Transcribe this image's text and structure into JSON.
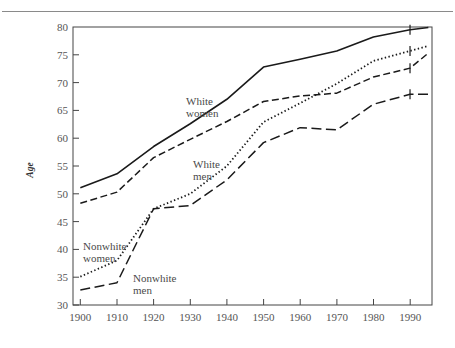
{
  "figure": {
    "rule_present": true,
    "axis": {
      "ylabel": "Age",
      "ylim": [
        30,
        80
      ],
      "yticks": [
        30,
        35,
        40,
        45,
        50,
        55,
        60,
        65,
        70,
        75,
        80
      ],
      "xlim": [
        1898,
        1996
      ],
      "xticks": [
        1900,
        1910,
        1920,
        1930,
        1940,
        1950,
        1960,
        1970,
        1980,
        1990
      ]
    },
    "labels": {
      "white_women_line1": "White",
      "white_women_line2": "women",
      "white_men_line1": "White",
      "white_men_line2": "men",
      "nonwhite_women_line1": "Nonwhite",
      "nonwhite_women_line2": "women",
      "nonwhite_men_line1": "Nonwhite",
      "nonwhite_men_line2": "men"
    }
  },
  "chart_data": {
    "type": "line",
    "title": "",
    "xlabel": "",
    "ylabel": "Age",
    "xlim": [
      1898,
      1996
    ],
    "ylim": [
      30,
      80
    ],
    "xticks": [
      1900,
      1910,
      1920,
      1930,
      1940,
      1950,
      1960,
      1970,
      1980,
      1990
    ],
    "yticks": [
      30,
      35,
      40,
      45,
      50,
      55,
      60,
      65,
      70,
      75,
      80
    ],
    "grid": false,
    "legend": "inline-labels",
    "x": [
      1900,
      1910,
      1920,
      1930,
      1940,
      1950,
      1960,
      1970,
      1980,
      1990,
      1995
    ],
    "series": [
      {
        "name": "White women",
        "style": "solid",
        "color": "#1a1a1a",
        "values": [
          51.1,
          53.6,
          58.5,
          62.6,
          67.0,
          72.8,
          74.2,
          75.7,
          78.2,
          79.5,
          79.9
        ]
      },
      {
        "name": "White men",
        "style": "dashed",
        "color": "#1a1a1a",
        "values": [
          48.3,
          50.3,
          56.5,
          59.8,
          63.0,
          66.6,
          67.6,
          68.1,
          71.0,
          72.6,
          75.3
        ]
      },
      {
        "name": "Nonwhite women",
        "style": "dotted",
        "color": "#1a1a1a",
        "values": [
          35.1,
          38.0,
          47.3,
          50.0,
          55.0,
          62.9,
          66.3,
          69.8,
          73.9,
          75.7,
          76.6
        ]
      },
      {
        "name": "Nonwhite men",
        "style": "long-dashed",
        "color": "#1a1a1a",
        "values": [
          32.7,
          34.0,
          47.3,
          47.9,
          52.5,
          59.2,
          61.9,
          61.5,
          66.1,
          67.9,
          67.9
        ]
      }
    ],
    "annotations": [
      {
        "text": "White women",
        "x": 1930,
        "y": 68.4
      },
      {
        "text": "White men",
        "x": 1932,
        "y": 57.0
      },
      {
        "text": "Nonwhite women",
        "x": 1904,
        "y": 41.0
      },
      {
        "text": "Nonwhite men",
        "x": 1923,
        "y": 35.2
      }
    ],
    "endpoint_markers": {
      "at_x": 1990,
      "series": [
        "White women",
        "White men",
        "Nonwhite women",
        "Nonwhite men"
      ]
    }
  }
}
